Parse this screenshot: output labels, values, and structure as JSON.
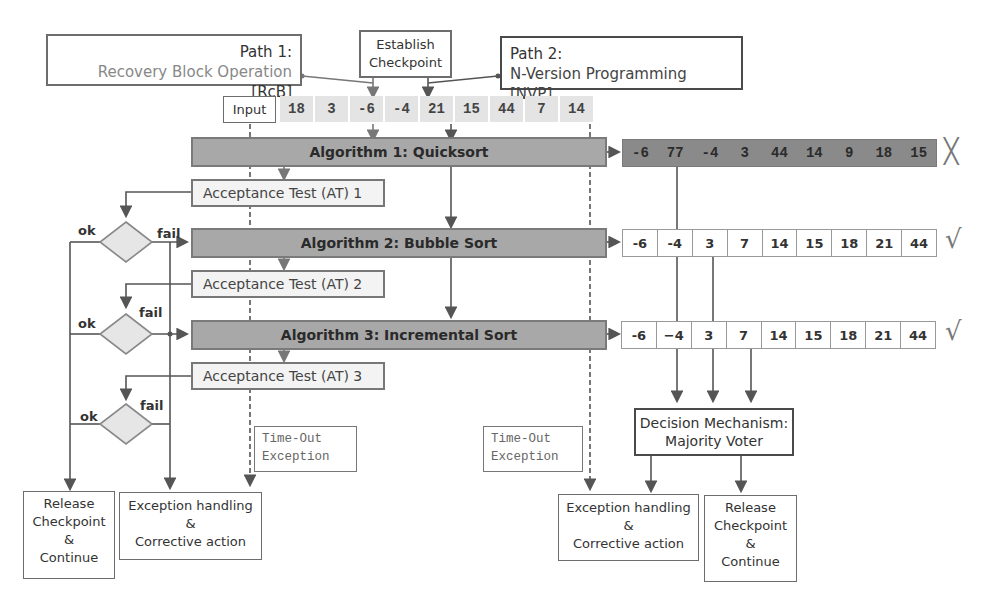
{
  "header": {
    "path1": {
      "title": "Path 1:",
      "subtitle": "Recovery Block Operation",
      "tag": "[RcB]"
    },
    "checkpoint": {
      "line1": "Establish",
      "line2": "Checkpoint"
    },
    "path2": {
      "title": "Path 2:",
      "subtitle": "N-Version Programming [NVP]"
    }
  },
  "input": {
    "label": "Input",
    "values": [
      "18",
      "3",
      "-6",
      "-4",
      "21",
      "15",
      "44",
      "7",
      "14"
    ]
  },
  "algorithms": [
    {
      "label": "Algorithm 1:  Quicksort"
    },
    {
      "label": "Algorithm 2:  Bubble Sort"
    },
    {
      "label": "Algorithm 3:  Incremental Sort"
    }
  ],
  "acceptance_tests": [
    {
      "label": "Acceptance Test (AT) 1"
    },
    {
      "label": "Acceptance Test (AT) 2"
    },
    {
      "label": "Acceptance Test (AT) 3"
    }
  ],
  "decisions": [
    {
      "ok": "ok",
      "fail": "fail"
    },
    {
      "ok": "ok",
      "fail": "fail"
    },
    {
      "ok": "ok",
      "fail": "fail"
    }
  ],
  "outputs": [
    {
      "values": [
        "-6",
        "77",
        "-4",
        "3",
        "44",
        "14",
        "9",
        "18",
        "15"
      ],
      "status": "incorrect",
      "mark": "╳"
    },
    {
      "values": [
        "-6",
        "-4",
        "3",
        "7",
        "14",
        "15",
        "18",
        "21",
        "44"
      ],
      "status": "correct",
      "mark": "√"
    },
    {
      "values": [
        "-6",
        "−4",
        "3",
        "7",
        "14",
        "15",
        "18",
        "21",
        "44"
      ],
      "status": "correct",
      "mark": "√"
    }
  ],
  "timeouts": [
    {
      "line1": "Time-Out",
      "line2": "Exception"
    },
    {
      "line1": "Time-Out",
      "line2": "Exception"
    }
  ],
  "decision_mechanism": {
    "line1": "Decision Mechanism:",
    "line2": "Majority Voter"
  },
  "rcb_endpoints": {
    "release": {
      "l1": "Release",
      "l2": "Checkpoint",
      "l3": "&",
      "l4": "Continue"
    },
    "exception": {
      "l1": "Exception handling",
      "l2": "&",
      "l3": "Corrective action"
    }
  },
  "nvp_endpoints": {
    "exception": {
      "l1": "Exception handling",
      "l2": "&",
      "l3": "Corrective action"
    },
    "release": {
      "l1": "Release",
      "l2": "Checkpoint",
      "l3": "&",
      "l4": "Continue"
    }
  },
  "colors": {
    "algo_fill": "#a8a8a8",
    "bad_output_fill": "#8a8a8a",
    "input_cell_fill": "#e4e4e4",
    "at_fill": "#f3f3f3",
    "line": "#555555"
  }
}
